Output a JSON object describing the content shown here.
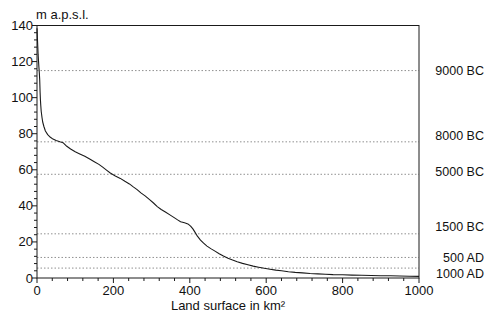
{
  "chart": {
    "title": "m a.p.s.l.",
    "xlabel": "Land surface in km²"
  },
  "colors": {
    "background": "#ffffff",
    "frame": "#1a1a1a",
    "curve": "#1a1a1a",
    "gridline": "#909090",
    "text": "#111111"
  },
  "chart_data": {
    "type": "line",
    "title": "m a.p.s.l.",
    "xlabel": "Land surface in km²",
    "ylabel": "m a.p.s.l.",
    "xlim": [
      0,
      1000
    ],
    "ylim": [
      0,
      140
    ],
    "x_ticks": [
      0,
      200,
      400,
      600,
      800,
      1000
    ],
    "y_ticks": [
      0,
      20,
      40,
      60,
      80,
      100,
      120,
      140
    ],
    "x_minor_step": 40,
    "y_minor_step": 4,
    "grid": "horizontal dashed lines only at era levels",
    "legend": "none",
    "era_lines": [
      {
        "label": "9000 BC",
        "level_m": 115
      },
      {
        "label": "8000 BC",
        "level_m": 75.5
      },
      {
        "label": "5000 BC",
        "level_m": 57.5
      },
      {
        "label": "1500 BC",
        "level_m": 24.5
      },
      {
        "label": "500 AD",
        "level_m": 11.4
      },
      {
        "label": "1000 AD",
        "level_m": 5.5
      }
    ],
    "series": [
      {
        "name": "water level vs flooded land surface",
        "points": [
          [
            0,
            138.5
          ],
          [
            1,
            133
          ],
          [
            2,
            128
          ],
          [
            3,
            124
          ],
          [
            4,
            120.5
          ],
          [
            5,
            117
          ],
          [
            6,
            114
          ],
          [
            7,
            110
          ],
          [
            8,
            103
          ],
          [
            9,
            99
          ],
          [
            10,
            95.5
          ],
          [
            11,
            92.5
          ],
          [
            13,
            89
          ],
          [
            15,
            86.5
          ],
          [
            18,
            84
          ],
          [
            22,
            81.5
          ],
          [
            28,
            79.5
          ],
          [
            35,
            78
          ],
          [
            42,
            77
          ],
          [
            50,
            76.2
          ],
          [
            60,
            75.5
          ],
          [
            68,
            75
          ],
          [
            78,
            73
          ],
          [
            88,
            71.5
          ],
          [
            100,
            70
          ],
          [
            112,
            68.8
          ],
          [
            125,
            67.5
          ],
          [
            138,
            66
          ],
          [
            150,
            64.5
          ],
          [
            162,
            63
          ],
          [
            172,
            61.5
          ],
          [
            182,
            59.8
          ],
          [
            192,
            58.2
          ],
          [
            205,
            56.6
          ],
          [
            218,
            55.2
          ],
          [
            230,
            53.6
          ],
          [
            242,
            52.2
          ],
          [
            252,
            50.5
          ],
          [
            262,
            49
          ],
          [
            272,
            47.2
          ],
          [
            283,
            45.5
          ],
          [
            294,
            43.6
          ],
          [
            305,
            41.6
          ],
          [
            315,
            39.6
          ],
          [
            325,
            38
          ],
          [
            336,
            36.6
          ],
          [
            348,
            35
          ],
          [
            358,
            33.6
          ],
          [
            368,
            32.2
          ],
          [
            376,
            31.2
          ],
          [
            386,
            30.6
          ],
          [
            395,
            30
          ],
          [
            402,
            28.8
          ],
          [
            408,
            27.2
          ],
          [
            414,
            25.3
          ],
          [
            420,
            23.2
          ],
          [
            428,
            21
          ],
          [
            436,
            19.3
          ],
          [
            445,
            17.7
          ],
          [
            455,
            16.3
          ],
          [
            466,
            14.9
          ],
          [
            477,
            13.5
          ],
          [
            488,
            12.2
          ],
          [
            500,
            11
          ],
          [
            512,
            9.9
          ],
          [
            524,
            9
          ],
          [
            538,
            8.1
          ],
          [
            552,
            7.3
          ],
          [
            566,
            6.6
          ],
          [
            580,
            6
          ],
          [
            595,
            5.4
          ],
          [
            610,
            4.9
          ],
          [
            625,
            4.4
          ],
          [
            640,
            4
          ],
          [
            658,
            3.5
          ],
          [
            676,
            3.1
          ],
          [
            695,
            2.8
          ],
          [
            715,
            2.5
          ],
          [
            735,
            2.3
          ],
          [
            755,
            2.1
          ],
          [
            775,
            1.9
          ],
          [
            800,
            1.8
          ],
          [
            825,
            1.6
          ],
          [
            850,
            1.5
          ],
          [
            875,
            1.4
          ],
          [
            900,
            1.3
          ],
          [
            925,
            1.2
          ],
          [
            950,
            1.1
          ],
          [
            975,
            1.0
          ],
          [
            1000,
            0.9
          ]
        ]
      }
    ]
  }
}
